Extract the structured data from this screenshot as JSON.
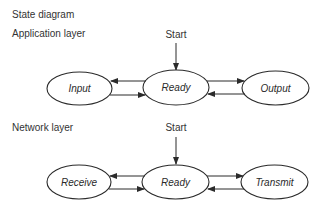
{
  "title": "State diagram",
  "colors": {
    "stroke": "#2b2b2b",
    "text": "#333333",
    "background": "#ffffff"
  },
  "layers": [
    {
      "label": "Application layer",
      "start_label": "Start",
      "states": [
        {
          "name": "Input"
        },
        {
          "name": "Ready"
        },
        {
          "name": "Output"
        }
      ],
      "transitions": [
        {
          "from": "Ready",
          "to": "Input"
        },
        {
          "from": "Input",
          "to": "Ready"
        },
        {
          "from": "Ready",
          "to": "Output"
        },
        {
          "from": "Output",
          "to": "Ready"
        },
        {
          "from": "Start",
          "to": "Ready"
        }
      ]
    },
    {
      "label": "Network layer",
      "start_label": "Start",
      "states": [
        {
          "name": "Receive"
        },
        {
          "name": "Ready"
        },
        {
          "name": "Transmit"
        }
      ],
      "transitions": [
        {
          "from": "Ready",
          "to": "Receive"
        },
        {
          "from": "Receive",
          "to": "Ready"
        },
        {
          "from": "Ready",
          "to": "Transmit"
        },
        {
          "from": "Transmit",
          "to": "Ready"
        },
        {
          "from": "Start",
          "to": "Ready"
        }
      ]
    }
  ]
}
